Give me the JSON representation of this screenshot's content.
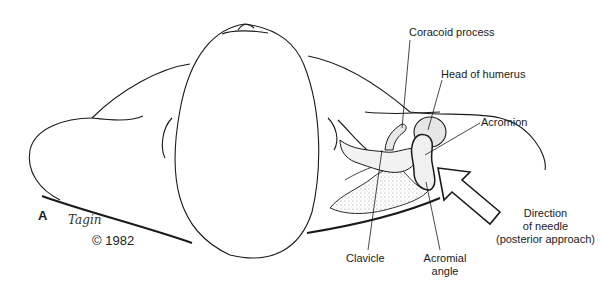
{
  "figure": {
    "panel_label": "A",
    "signature": "Tagin",
    "copyright": "© 1982"
  },
  "labels": {
    "coracoid_process": "Coracoid process",
    "head_of_humerus": "Head of humerus",
    "acromion": "Acromion",
    "clavicle": "Clavicle",
    "acromial_angle_line1": "Acromial",
    "acromial_angle_line2": "angle",
    "direction_line1": "Direction",
    "direction_line2": "of needle",
    "direction_line3": "(posterior approach)"
  },
  "colors": {
    "line": "#1a1a1a",
    "shading": "#9a9a9a",
    "background": "#ffffff"
  }
}
